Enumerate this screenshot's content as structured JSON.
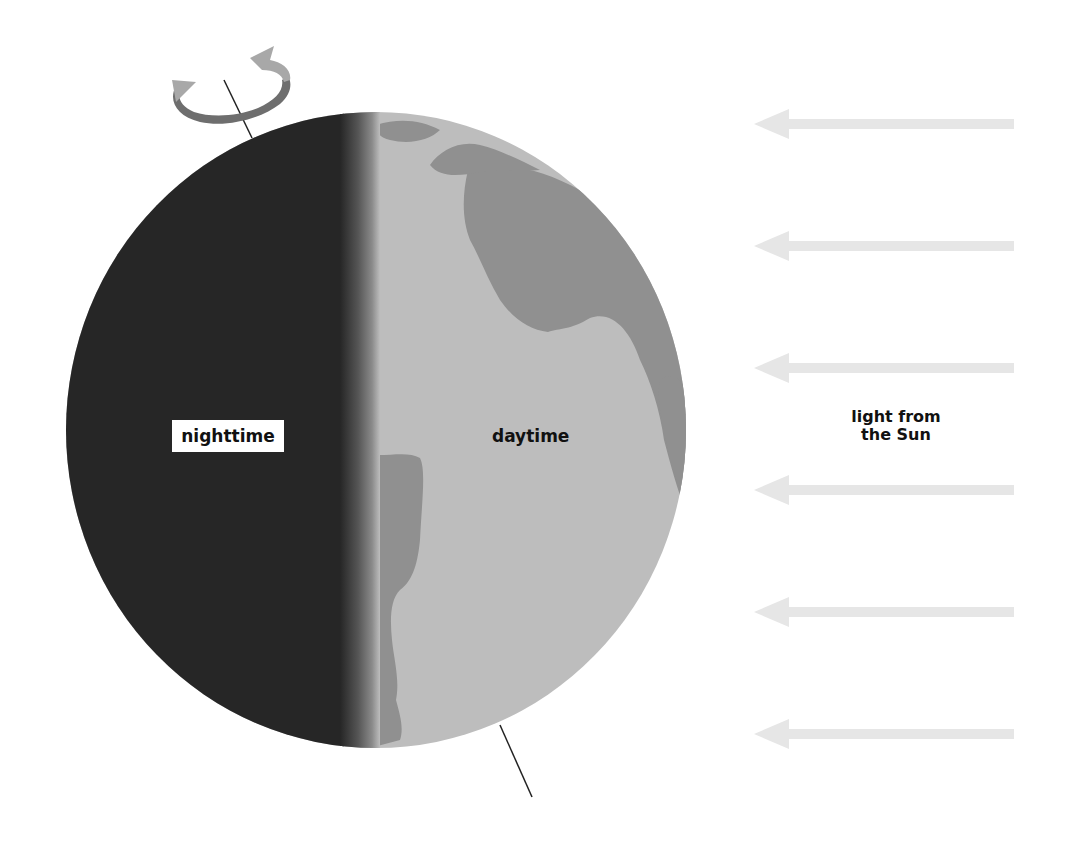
{
  "diagram": {
    "type": "earth-day-night",
    "labels": {
      "night": "nighttime",
      "day": "daytime",
      "sun_line1": "light from",
      "sun_line2": "the Sun"
    },
    "colors": {
      "night_side": "#262626",
      "day_ocean": "#bdbdbd",
      "day_land": "#909090",
      "sun_arrow": "#e6e6e6",
      "axis_line": "#222222",
      "rotation_arrow_dark": "#6e6e6e",
      "rotation_arrow_light": "#a8a8a8"
    },
    "sun_arrows": {
      "count": 6,
      "direction": "left"
    },
    "rotation_indicator": "counterclockwise-rotation-arrow-around-axis"
  }
}
